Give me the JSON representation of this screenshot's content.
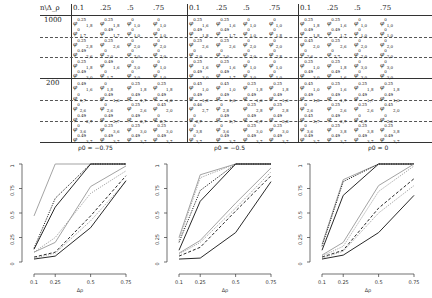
{
  "table": {
    "corner_label": "n\\Δ_ρ",
    "column_headers": [
      "0.1",
      ".25",
      ".5",
      ".75"
    ],
    "blocks": [
      {
        "rho_label": "ρ0 = −0.75"
      },
      {
        "rho_label": "ρ0 = −0.5"
      },
      {
        "rho_label": "ρ0 = 0"
      }
    ],
    "row_groups": [
      {
        "n": "1000"
      },
      {
        "n": "200"
      }
    ],
    "cells": {
      "block0": [
        [
          "φ^{0.25}_{1,8}",
          "φ^{0.25}_{1,8}",
          "φ^{0}_{1,0}",
          "φ^{0}_{1,0}"
        ],
        [
          "φ^{0}_{1,7}",
          "φ^{0.49}_{1,7}",
          "φ^{0}_{1,0}",
          "φ^{0}_{1,0}"
        ],
        [
          "φ^{0.25}_{2,8}",
          "φ^{0.25}_{2,6}",
          "φ^{0}_{2,0}",
          "φ^{0}_{2,0}"
        ],
        [
          "φ^{0.49}_{2,6}",
          "φ^{0}_{2,0}",
          "φ^{0}_{2,0}",
          "φ^{0}_{2,0}"
        ],
        [
          "φ^{0.25}_{1,8}",
          "φ^{0.49}_{1,6}",
          "φ^{0}_{3,0}",
          "φ^{0}_{1,0}"
        ],
        [
          "φ^{0.49}_{3,0}",
          "φ^{0}_{1,7}",
          "φ^{0}_{3,0}",
          "φ^{0}_{1,0}"
        ],
        [
          "φ^{0.49}_{1,6}",
          "φ^{0}_{1,8}",
          "φ^{0.25}_{1,8}",
          "φ^{0.25}_{1,8}"
        ],
        [
          "φ^{0}_{1,7}",
          "φ^{0.49}_{1,6}",
          "φ^{0.49}_{1,7}",
          "φ^{0.49}_{1,0}"
        ],
        [
          "φ^{0}_{2,6}",
          "φ^{0}_{2,6}",
          "φ^{0.25}_{2,6}",
          "φ^{0.45}_{2,0}"
        ],
        [
          "φ^{0.49}_{2,7}",
          "φ^{0.49}_{2,7}",
          "φ^{0.49}_{2,7}",
          "φ^{0}_{2,7}"
        ],
        [
          "φ^{0}_{3,6}",
          "φ^{0.25}_{3,6}",
          "φ^{0.25}_{3,0}",
          "φ^{0.25}_{3,0}"
        ],
        [
          "φ^{0.49}_{3,7}",
          "φ^{0.49}_{3,7}",
          "φ^{0.49}_{3,7}",
          "φ^{0.49}_{3,7}"
        ]
      ],
      "block1": [
        [
          "φ^{0.25}_{1,6}",
          "φ^{0.25}_{1,6}",
          "φ^{0}_{1,0}",
          "φ^{0}_{1,0}"
        ],
        [
          "φ^{0.49}_{1,8}",
          "φ^{0.49}_{1,7}",
          "φ^{0}_{1,0}",
          "φ^{0}_{1,8}"
        ],
        [
          "φ^{0.25}_{2,6}",
          "φ^{0.25}_{2,6}",
          "φ^{0}_{2,0}",
          "φ^{0}_{2,0}"
        ],
        [
          "φ^{0}_{2,0}",
          "φ^{0}_{2,0}",
          "φ^{0}_{2,0}",
          "φ^{0}_{2,8}"
        ],
        [
          "φ^{0.25}_{1,6}",
          "φ^{0.25}_{1,6}",
          "φ^{0}_{1,0}",
          "φ^{0}_{1,0}"
        ],
        [
          "φ^{0.49}_{3,0}",
          "φ^{0.49}_{1,7}",
          "φ^{0}_{3,0}",
          "φ^{0}_{1,0}"
        ],
        [
          "φ^{0.45}_{1,0}",
          "φ^{0.45}_{1,0}",
          "φ^{0.25}_{1,8}",
          "φ^{0.25}_{1,8}"
        ],
        [
          "φ^{0.49}_{1,8}",
          "φ^{0.49}_{1,6}",
          "φ^{0.49}_{1,6}",
          "φ^{0.49}_{1,6}"
        ],
        [
          "φ^{0.46}_{2,7}",
          "φ^{0}_{2,8}",
          "φ^{0.25}_{2,8}",
          "φ^{0.25}_{2,8}"
        ],
        [
          "φ^{0}_{2,7}",
          "φ^{0.49}_{2,7}",
          "φ^{0.49}_{2,7}",
          "φ^{0.49}_{2,8}"
        ],
        [
          "φ^{0}_{3,8}",
          "φ^{0}_{3,6}",
          "φ^{0.25}_{3,0}",
          "φ^{0.25}_{3,0}"
        ],
        [
          "φ^{0}_{3,7}",
          "φ^{0.49}_{3,7}",
          "φ^{0.49}_{3,7}",
          "φ^{0.49}_{3,7}"
        ]
      ],
      "block2": [
        [
          "φ^{0.25}_{1,8}",
          "φ^{0.25}_{1,6}",
          "φ^{0}_{1,0}",
          "φ^{0}_{1,0}"
        ],
        [
          "φ^{0.49}_{1,8}",
          "φ^{0.49}_{1,7}",
          "φ^{0}_{1,0}",
          "φ^{0}_{1,0}"
        ],
        [
          "φ^{0.45}_{2,0}",
          "φ^{0.25}_{2,6}",
          "φ^{0}_{2,0}",
          "φ^{0}_{2,0}"
        ],
        [
          "φ^{0}_{2,6}",
          "φ^{0}_{2,7}",
          "φ^{0}_{2,0}",
          "φ^{0}_{2,0}"
        ],
        [
          "φ^{0.25}_{1,0}",
          "φ^{0.25}_{1,8}",
          "φ^{0}_{3,0}",
          "φ^{0}_{3,0}"
        ],
        [
          "φ^{0.49}_{3,0}",
          "φ^{0.49}_{1,6}",
          "φ^{0}_{3,0}",
          "φ^{0}_{3,0}"
        ],
        [
          "φ^{0.45}_{1,0}",
          "φ^{0.25}_{1,6}",
          "φ^{0.25}_{1,8}",
          "φ^{0.25}_{1,8}"
        ],
        [
          "φ^{0.49}_{1,8}",
          "φ^{0.49}_{1,7}",
          "φ^{0.49}_{1,7}",
          "φ^{0.49}_{1,0}"
        ],
        [
          "φ^{0}_{2,6}",
          "φ^{0.25}_{2,6}",
          "φ^{0.25}_{2,6}",
          "φ^{0.45}_{2,0}"
        ],
        [
          "φ^{0.45}_{2,7}",
          "φ^{0.49}_{2,7}",
          "φ^{0}_{2,7}",
          "φ^{0}_{2,0}"
        ],
        [
          "φ^{0}_{3,6}",
          "φ^{0.25}_{3,8}",
          "φ^{0.25}_{3,8}",
          "φ^{0.25}_{3,8}"
        ],
        [
          "φ^{0.49}_{3,7}",
          "φ^{0.49}_{3,7}",
          "φ^{0.49}_{3,7}",
          "φ^{0.49}_{3,7}"
        ]
      ]
    }
  },
  "chart_data": [
    {
      "type": "line",
      "title": "ρ0 = −0.75",
      "xlabel": "Δρ",
      "ylabel": "",
      "x": [
        0.1,
        0.25,
        0.5,
        0.75
      ],
      "xticks": [
        "0.1",
        "0.25",
        "0.5",
        "0.75"
      ],
      "yticks": [
        "0",
        "0.25",
        "0.5",
        "0.75",
        "1"
      ],
      "ylim": [
        0,
        1
      ],
      "series": [
        {
          "name": "s1",
          "style": "solid-gray",
          "values": [
            0.47,
            1.0,
            1.0,
            1.0
          ]
        },
        {
          "name": "s2",
          "style": "dotted-black",
          "values": [
            0.14,
            0.65,
            1.0,
            1.0
          ]
        },
        {
          "name": "s3",
          "style": "solid-black",
          "values": [
            0.13,
            0.56,
            1.0,
            1.0
          ]
        },
        {
          "name": "s4",
          "style": "solid-gray",
          "values": [
            0.1,
            0.2,
            0.77,
            0.98
          ]
        },
        {
          "name": "s5",
          "style": "dotted-gray",
          "values": [
            0.1,
            0.25,
            0.7,
            0.93
          ]
        },
        {
          "name": "s6",
          "style": "dashed-black",
          "values": [
            0.05,
            0.1,
            0.47,
            0.88
          ]
        },
        {
          "name": "s7",
          "style": "dotted-gray",
          "values": [
            0.04,
            0.09,
            0.42,
            0.82
          ]
        },
        {
          "name": "s8",
          "style": "solid-black",
          "values": [
            0.03,
            0.06,
            0.35,
            0.83
          ]
        }
      ]
    },
    {
      "type": "line",
      "title": "ρ0 = −0.5",
      "xlabel": "Δρ",
      "ylabel": "",
      "x": [
        0.1,
        0.25,
        0.5,
        0.75
      ],
      "xticks": [
        "0.1",
        "0.25",
        "0.5",
        "0.75"
      ],
      "yticks": [
        "0",
        "0.25",
        "0.5",
        "0.75",
        "1"
      ],
      "ylim": [
        0,
        1
      ],
      "series": [
        {
          "name": "s1",
          "style": "solid-gray",
          "values": [
            0.25,
            0.89,
            1.0,
            1.0
          ]
        },
        {
          "name": "s2",
          "style": "dotted-gray",
          "values": [
            0.22,
            0.86,
            1.0,
            1.0
          ]
        },
        {
          "name": "s3",
          "style": "dotted-black",
          "values": [
            0.2,
            0.73,
            1.0,
            1.0
          ]
        },
        {
          "name": "s4",
          "style": "solid-black",
          "values": [
            0.12,
            0.62,
            1.0,
            1.0
          ]
        },
        {
          "name": "s5",
          "style": "solid-gray",
          "values": [
            0.09,
            0.22,
            0.6,
            0.96
          ]
        },
        {
          "name": "s6",
          "style": "dotted-gray",
          "values": [
            0.08,
            0.2,
            0.55,
            0.92
          ]
        },
        {
          "name": "s7",
          "style": "dashed-black",
          "values": [
            0.06,
            0.15,
            0.52,
            0.88
          ]
        },
        {
          "name": "s8",
          "style": "solid-black",
          "values": [
            0.03,
            0.04,
            0.3,
            0.82
          ]
        }
      ]
    },
    {
      "type": "line",
      "title": "ρ0 = 0",
      "xlabel": "Δρ",
      "ylabel": "",
      "x": [
        0.1,
        0.25,
        0.5,
        0.75
      ],
      "xticks": [
        "0.1",
        "0.25",
        "0.5",
        "0.75"
      ],
      "yticks": [
        "0",
        "0.25",
        "0.5",
        "0.75",
        "1"
      ],
      "ylim": [
        0,
        1
      ],
      "series": [
        {
          "name": "s1",
          "style": "solid-gray",
          "values": [
            0.18,
            0.84,
            1.0,
            1.0
          ]
        },
        {
          "name": "s2",
          "style": "dotted-black",
          "values": [
            0.16,
            0.82,
            1.0,
            1.0
          ]
        },
        {
          "name": "s3",
          "style": "solid-black",
          "values": [
            0.12,
            0.68,
            1.0,
            1.0
          ]
        },
        {
          "name": "s4",
          "style": "solid-gray",
          "values": [
            0.07,
            0.2,
            0.78,
            1.0
          ]
        },
        {
          "name": "s5",
          "style": "dotted-gray",
          "values": [
            0.06,
            0.16,
            0.72,
            0.98
          ]
        },
        {
          "name": "s6",
          "style": "dashed-black",
          "values": [
            0.05,
            0.12,
            0.55,
            0.85
          ]
        },
        {
          "name": "s7",
          "style": "dotted-gray",
          "values": [
            0.04,
            0.11,
            0.5,
            0.78
          ]
        },
        {
          "name": "s8",
          "style": "solid-black",
          "values": [
            0.03,
            0.07,
            0.3,
            0.68
          ]
        }
      ]
    }
  ]
}
